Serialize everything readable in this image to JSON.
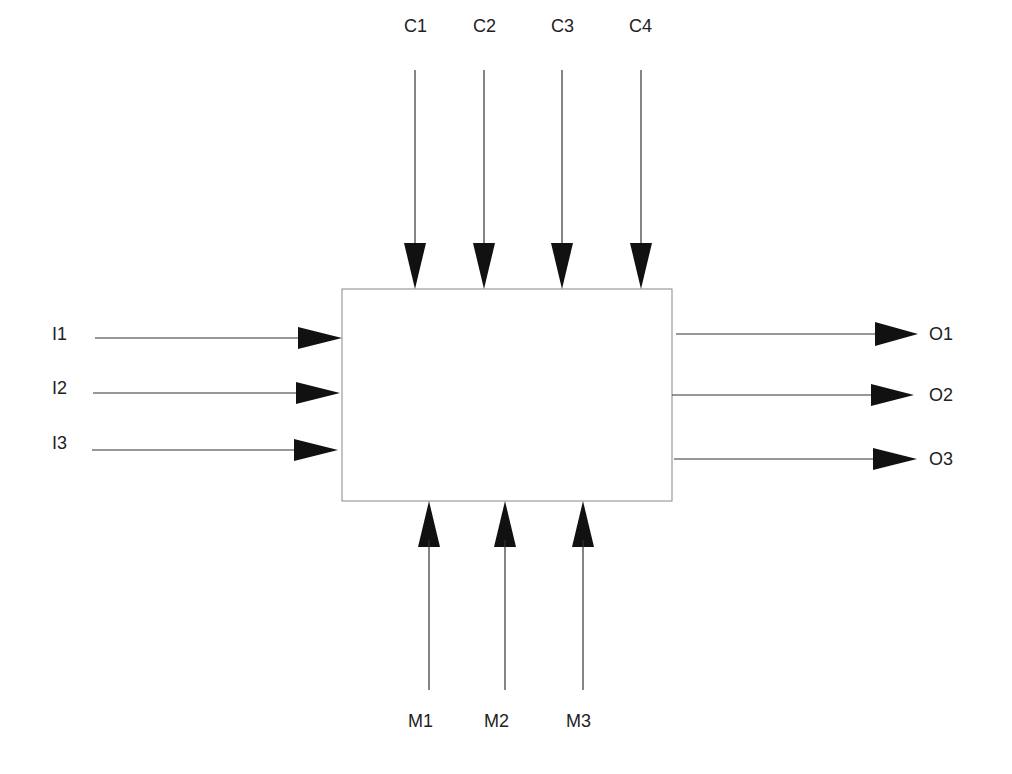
{
  "diagram": {
    "type": "IDEF0 activity box",
    "box": {
      "x": 342,
      "y": 289,
      "w": 330,
      "h": 212,
      "label": ""
    },
    "controls": [
      {
        "label": "C1",
        "x": 415
      },
      {
        "label": "C2",
        "x": 484
      },
      {
        "label": "C3",
        "x": 562
      },
      {
        "label": "C4",
        "x": 641
      }
    ],
    "inputs": [
      {
        "label": "I1",
        "y": 338
      },
      {
        "label": "I2",
        "y": 393
      },
      {
        "label": "I3",
        "y": 450
      }
    ],
    "outputs": [
      {
        "label": "O1",
        "y": 334
      },
      {
        "label": "O2",
        "y": 395
      },
      {
        "label": "O3",
        "y": 459
      }
    ],
    "mechanisms": [
      {
        "label": "M1",
        "x": 429
      },
      {
        "label": "M2",
        "x": 505
      },
      {
        "label": "M3",
        "x": 583
      }
    ],
    "colors": {
      "line": "#333333",
      "arrowhead": "#111111",
      "box_border": "#888888"
    }
  }
}
